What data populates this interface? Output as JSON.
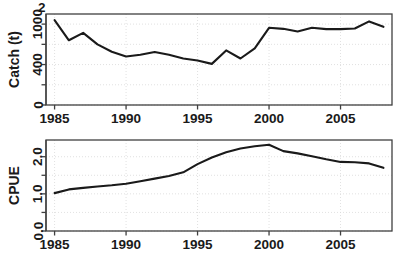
{
  "figure": {
    "background": "#ffffff",
    "line_color": "#1a1a1a",
    "grid_color": "#d9d9d9",
    "frame_color": "#404040",
    "artifact_glyph": "2",
    "panels": [
      "catch",
      "cpue"
    ]
  },
  "chart_data": [
    {
      "type": "line",
      "id": "catch",
      "title": "",
      "xlabel": "",
      "ylabel": "Catch (t)",
      "xlim": [
        1984.4,
        2008.6
      ],
      "ylim": [
        0,
        1150
      ],
      "xticks": [
        1985,
        1990,
        1995,
        2000,
        2005
      ],
      "xticklabels": [
        "1985",
        "1990",
        "1995",
        "2000",
        "2005"
      ],
      "yticks": [
        0,
        400,
        1000
      ],
      "yticklabels": [
        "0",
        "400",
        "1000"
      ],
      "yticks_minor": [
        200,
        700
      ],
      "y_scale": "sqrt-like",
      "grid": true,
      "legend": "none",
      "x": [
        1985,
        1986,
        1987,
        1988,
        1989,
        1990,
        1991,
        1992,
        1993,
        1994,
        1995,
        1996,
        1997,
        1998,
        1999,
        2000,
        2001,
        2002,
        2003,
        2004,
        2005,
        2006,
        2007,
        2008
      ],
      "values": [
        1060,
        760,
        870,
        700,
        590,
        520,
        545,
        585,
        545,
        490,
        460,
        410,
        610,
        490,
        640,
        945,
        930,
        890,
        945,
        925,
        925,
        935,
        1040,
        960
      ]
    },
    {
      "type": "line",
      "id": "cpue",
      "title": "",
      "xlabel": "",
      "ylabel": "CPUE",
      "xlim": [
        1984.4,
        2008.6
      ],
      "ylim": [
        0.0,
        2.45
      ],
      "xticks": [
        1985,
        1990,
        1995,
        2000,
        2005
      ],
      "xticklabels": [
        "1985",
        "1990",
        "1995",
        "2000",
        "2005"
      ],
      "yticks": [
        0.0,
        1.0,
        2.0
      ],
      "yticklabels": [
        "0.0",
        "1.0",
        "2.0"
      ],
      "yticks_minor": [
        0.5,
        1.5
      ],
      "y_scale": "linear",
      "grid": true,
      "legend": "none",
      "x": [
        1985,
        1986,
        1987,
        1988,
        1989,
        1990,
        1991,
        1992,
        1993,
        1994,
        1995,
        1996,
        1997,
        1998,
        1999,
        2000,
        2001,
        2002,
        2003,
        2004,
        2005,
        2006,
        2007,
        2008
      ],
      "values": [
        1.02,
        1.12,
        1.16,
        1.2,
        1.23,
        1.27,
        1.34,
        1.41,
        1.48,
        1.58,
        1.8,
        1.98,
        2.12,
        2.22,
        2.28,
        2.32,
        2.15,
        2.09,
        2.01,
        1.93,
        1.86,
        1.85,
        1.82,
        1.7
      ]
    }
  ]
}
